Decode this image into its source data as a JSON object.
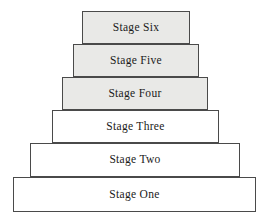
{
  "diagram": {
    "type": "stepped-pyramid",
    "orientation": "bottom-up",
    "background_color": "#ffffff",
    "border_color": "#4a4a4a",
    "filled_color": "#e9e9e7",
    "unfilled_color": "#ffffff",
    "levels": [
      {
        "label": "Stage Six",
        "level": 6,
        "filled": true,
        "left": 82,
        "top": 11,
        "width": 108,
        "height": 33
      },
      {
        "label": "Stage Five",
        "level": 5,
        "filled": true,
        "left": 73,
        "top": 44,
        "width": 126,
        "height": 33
      },
      {
        "label": "Stage Four",
        "level": 4,
        "filled": true,
        "left": 62,
        "top": 77,
        "width": 146,
        "height": 33
      },
      {
        "label": "Stage Three",
        "level": 3,
        "filled": false,
        "left": 52,
        "top": 110,
        "width": 167,
        "height": 33
      },
      {
        "label": "Stage Two",
        "level": 2,
        "filled": false,
        "left": 30,
        "top": 143,
        "width": 210,
        "height": 34
      },
      {
        "label": "Stage One",
        "level": 1,
        "filled": false,
        "left": 13,
        "top": 177,
        "width": 243,
        "height": 35
      }
    ]
  }
}
